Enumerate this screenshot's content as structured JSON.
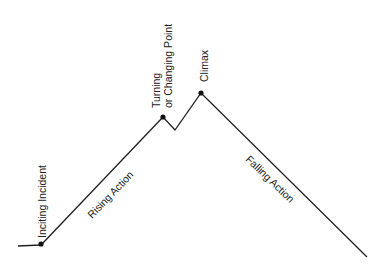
{
  "diagram": {
    "line_color": "#222222",
    "points": {
      "start": [
        18,
        246
      ],
      "inciting": [
        41,
        245
      ],
      "turning": [
        163,
        117
      ],
      "dip": [
        175,
        130
      ],
      "climax": [
        201,
        93
      ],
      "end": [
        367,
        257
      ]
    },
    "labels": {
      "inciting_incident": "Inciting Incident",
      "rising_action": "Rising Action",
      "turning_line1": "Turning",
      "turning_line2": "or Changing Point",
      "climax": "Climax",
      "falling_action": "Falling Action"
    }
  }
}
